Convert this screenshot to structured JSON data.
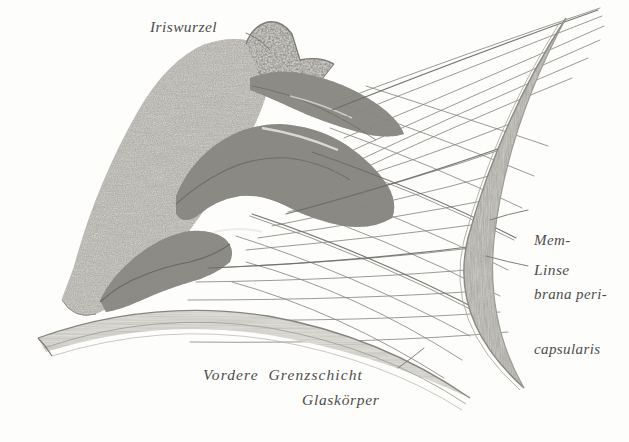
{
  "figure": {
    "kind": "anatomical-engraving",
    "background_color": "#fdfdfc",
    "ink_color": "#4e4e4c",
    "tissue_light": "#cfcdc8",
    "tissue_mid": "#a9a7a1",
    "tissue_dark": "#6f6d68"
  },
  "labels": {
    "iriswurzel": "Iriswurzel",
    "membrana_line1": "Mem-",
    "membrana_line2": "brana peri-",
    "membrana_line3": "capsularis",
    "linse": "Linse",
    "vordere_grenzschicht": "Vordere  Grenzschicht",
    "glaskoerper": "Glaskörper"
  },
  "structures": [
    {
      "name": "iris-root",
      "label": "Iriswurzel"
    },
    {
      "name": "ciliary-body",
      "label": ""
    },
    {
      "name": "ciliary-processes",
      "label": ""
    },
    {
      "name": "zonule-fibres",
      "label": ""
    },
    {
      "name": "membrana-pericapsularis",
      "label": "Membrana pericapsularis"
    },
    {
      "name": "lens",
      "label": "Linse"
    },
    {
      "name": "anterior-vitreous-boundary",
      "label": "Vordere Grenzschicht"
    },
    {
      "name": "vitreous-body",
      "label": "Glaskörper"
    }
  ],
  "leader_lines": [
    {
      "name": "leader-iriswurzel",
      "from": "Iriswurzel label",
      "to": "iris root"
    },
    {
      "name": "leader-membrana",
      "from": "Membrana pericapsularis label",
      "to": "lens capsule"
    },
    {
      "name": "leader-linse",
      "from": "Linse label",
      "to": "lens substance"
    },
    {
      "name": "leader-grenzschicht",
      "from": "Vordere Grenzschicht label",
      "to": "vitreous boundary"
    }
  ]
}
